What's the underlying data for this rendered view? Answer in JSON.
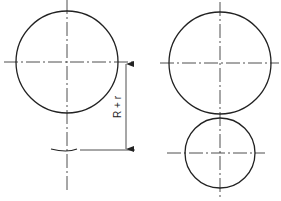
{
  "diagram": {
    "dimension_label": "R + r",
    "colors": {
      "line": "#222222",
      "background": "#ffffff"
    },
    "left_figure": {
      "large_circle": {
        "cx": 67,
        "cy": 62,
        "r": 51
      },
      "small_circle_center_mark": {
        "cx": 67,
        "cy": 150
      }
    },
    "right_figure": {
      "large_circle": {
        "cx": 220,
        "cy": 63,
        "r": 51
      },
      "small_circle": {
        "cx": 220,
        "cy": 153,
        "r": 35
      }
    }
  }
}
